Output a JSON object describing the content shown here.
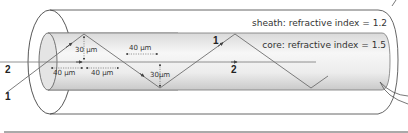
{
  "diagram": {
    "sheath_label": "sheath: refractive index = 1.2",
    "core_label": "core: refractive index = 1.5",
    "rays": [
      {
        "id": "1",
        "label": "1",
        "description": "zig-zag ray reflecting off core walls"
      },
      {
        "id": "2",
        "label": "2",
        "description": "straight ray along axis"
      }
    ],
    "dimensions": {
      "vertical_1": "30 µm",
      "horizontal_1": "40 µm",
      "horizontal_2": "40 µm",
      "horizontal_3": "40 µm",
      "vertical_2": "30µm"
    },
    "colors": {
      "outline": "#555555",
      "core_fill_light": "#f4f4f4",
      "core_fill_dark": "#cfcfcf",
      "ray": "#6e6e6e",
      "text": "#333333"
    }
  }
}
